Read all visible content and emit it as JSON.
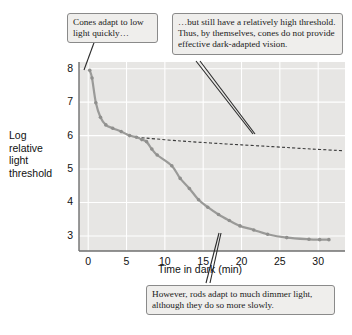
{
  "chart_data": {
    "type": "line",
    "title": "",
    "xlabel": "Time in dark (min)",
    "ylabel": "Log relative light threshold",
    "xlim": [
      -1.2,
      33.5
    ],
    "ylim": [
      2.55,
      8.2
    ],
    "xticks": [
      0,
      5,
      10,
      15,
      20,
      25,
      30
    ],
    "yticks": [
      3,
      4,
      5,
      6,
      7,
      8
    ],
    "grid": true,
    "legend": "none",
    "plot_background": "#e7e6e4",
    "gridline_color": "#ffffff",
    "series": [
      {
        "name": "Dark adaptation curve (rods and cones)",
        "style": "solid-with-markers",
        "color": "#9a9a98",
        "x": [
          0.2,
          0.5,
          1.0,
          1.6,
          2.3,
          3.2,
          4.3,
          5.4,
          6.3,
          7.0,
          7.6,
          8.3,
          9.0,
          10.9,
          12.0,
          13.2,
          14.4,
          15.6,
          17.0,
          18.4,
          19.8,
          21.6,
          23.4,
          25.9,
          28.8,
          30.2,
          31.4
        ],
        "y": [
          7.95,
          7.72,
          6.98,
          6.55,
          6.32,
          6.22,
          6.12,
          6.0,
          5.95,
          5.88,
          5.82,
          5.6,
          5.42,
          5.1,
          4.72,
          4.42,
          4.08,
          3.86,
          3.64,
          3.46,
          3.3,
          3.18,
          3.05,
          2.95,
          2.9,
          2.89,
          2.89
        ]
      },
      {
        "name": "Cone-only threshold",
        "style": "dashed",
        "color": "#3a3a3a",
        "x": [
          6.3,
          12.0,
          18.0,
          24.0,
          29.0,
          33.2
        ],
        "y": [
          5.95,
          5.84,
          5.75,
          5.67,
          5.6,
          5.55
        ]
      }
    ]
  },
  "axes": {
    "y_title_lines": [
      "Log",
      "relative",
      "light",
      "threshold"
    ],
    "y_tick_labels": [
      "8",
      "7",
      "6",
      "5",
      "4",
      "3"
    ],
    "x_tick_labels": [
      "0",
      "5",
      "10",
      "15",
      "20",
      "25",
      "30"
    ],
    "x_title": "Time in dark (min)"
  },
  "callouts": [
    {
      "id": "cones-fast",
      "text": "Cones adapt to low light quickly…"
    },
    {
      "id": "cone-high-threshold",
      "text": "…but still have a relatively high threshold. Thus, by themselves, cones do not provide effective dark-adapted vision."
    },
    {
      "id": "rods-dimmer",
      "text": "However, rods adapt to much dimmer light, although they do so more slowly."
    }
  ],
  "colors": {
    "curve": "#9a9a98",
    "cone_dashed": "#3a3a3a",
    "plot_bg": "#e7e6e4",
    "grid": "#ffffff",
    "axis": "#6f6f6f",
    "callout_bg": "#efeeec",
    "callout_border": "#8a8a8a",
    "leader": "#2b2b2b",
    "text": "#111111"
  }
}
